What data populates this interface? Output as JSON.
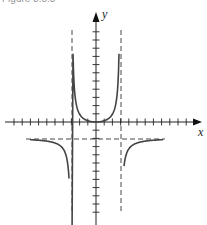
{
  "figure": {
    "caption": "Figure 3.5.3",
    "axes": {
      "x_label": "x",
      "y_label": "y"
    }
  },
  "chart_data": {
    "type": "line",
    "title": "",
    "xlabel": "x",
    "ylabel": "y",
    "grid": false,
    "axis_ticks": {
      "x_spacing": 1,
      "y_spacing": 1
    },
    "asymptotes": {
      "vertical": [
        -3,
        3
      ],
      "horizontal": [
        -2
      ]
    },
    "series": [
      {
        "name": "middle branch (between vertical asymptotes)",
        "shape": "U-shaped, minimum at origin",
        "x_range": [
          -2.9,
          2.9
        ],
        "min_point": [
          0,
          0
        ],
        "y_range": [
          0,
          11
        ]
      },
      {
        "name": "left branch",
        "x_range": [
          -8,
          -3.1
        ],
        "approaches": "y -> -2 as x -> -inf, y -> -inf as x -> -3-"
      },
      {
        "name": "right branch",
        "x_range": [
          3.1,
          8
        ],
        "approaches": "y -> -2 as x -> +inf, y -> -inf as x -> 3+"
      }
    ],
    "xlim": [
      -11,
      13
    ],
    "ylim": [
      -13,
      13
    ]
  }
}
